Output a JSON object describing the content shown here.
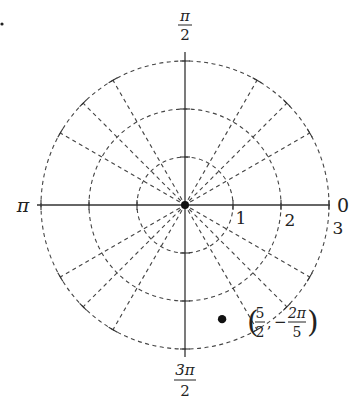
{
  "diagram": {
    "type": "polar-grid",
    "problem_marker": "•",
    "center_px": [
      185,
      205
    ],
    "unit_px": 48,
    "circle_radii": [
      1,
      2,
      3
    ],
    "ray_angles_deg": [
      30,
      45,
      60,
      120,
      135,
      150,
      210,
      225,
      240,
      300,
      315,
      330
    ],
    "axis_labels": {
      "right": "0",
      "top_num": "π",
      "top_den": "2",
      "left": "π",
      "bottom_num": "3π",
      "bottom_den": "2"
    },
    "radius_labels": [
      "1",
      "2",
      "3"
    ],
    "point": {
      "r": 2.5,
      "theta_deg": -72,
      "label_r_num": "5",
      "label_r_den": "2",
      "label_theta_sign": "−",
      "label_theta_num": "2π",
      "label_theta_den": "5"
    }
  }
}
